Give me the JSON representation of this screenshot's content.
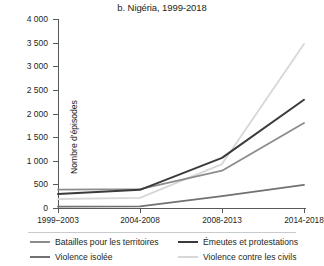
{
  "chart_data": {
    "type": "line",
    "title": "b. Nigéria, 1999-2018",
    "xlabel": "",
    "ylabel": "Nombre d'épisodes",
    "categories": [
      "1999–2003",
      "2004-2008",
      "2008-2013",
      "2014-2018"
    ],
    "ylim": [
      0,
      4000
    ],
    "yticks": [
      0,
      500,
      1000,
      1500,
      2000,
      2500,
      3000,
      3500,
      4000
    ],
    "ytick_labels": [
      "0",
      "500",
      "1 000",
      "1 500",
      "2 000",
      "2 500",
      "3 000",
      "3 500",
      "4 000"
    ],
    "grid": false,
    "legend_position": "bottom",
    "series": [
      {
        "name": "Batailles pour les territoires",
        "color": "#8a8c8e",
        "values": [
          390,
          400,
          790,
          1800
        ]
      },
      {
        "name": "Émeutes et protestations",
        "color": "#3b3a3c",
        "values": [
          295,
          385,
          1060,
          2290
        ]
      },
      {
        "name": "Violence isolée",
        "color": "#6f7173",
        "values": [
          30,
          35,
          250,
          490
        ]
      },
      {
        "name": "Violence contre les civils",
        "color": "#d6d7d8",
        "values": [
          190,
          215,
          930,
          3470
        ]
      }
    ]
  },
  "legend": {
    "items": [
      "Batailles pour les territoires",
      "Émeutes et protestations",
      "Violence isolée",
      "Violence contre les civils"
    ]
  }
}
